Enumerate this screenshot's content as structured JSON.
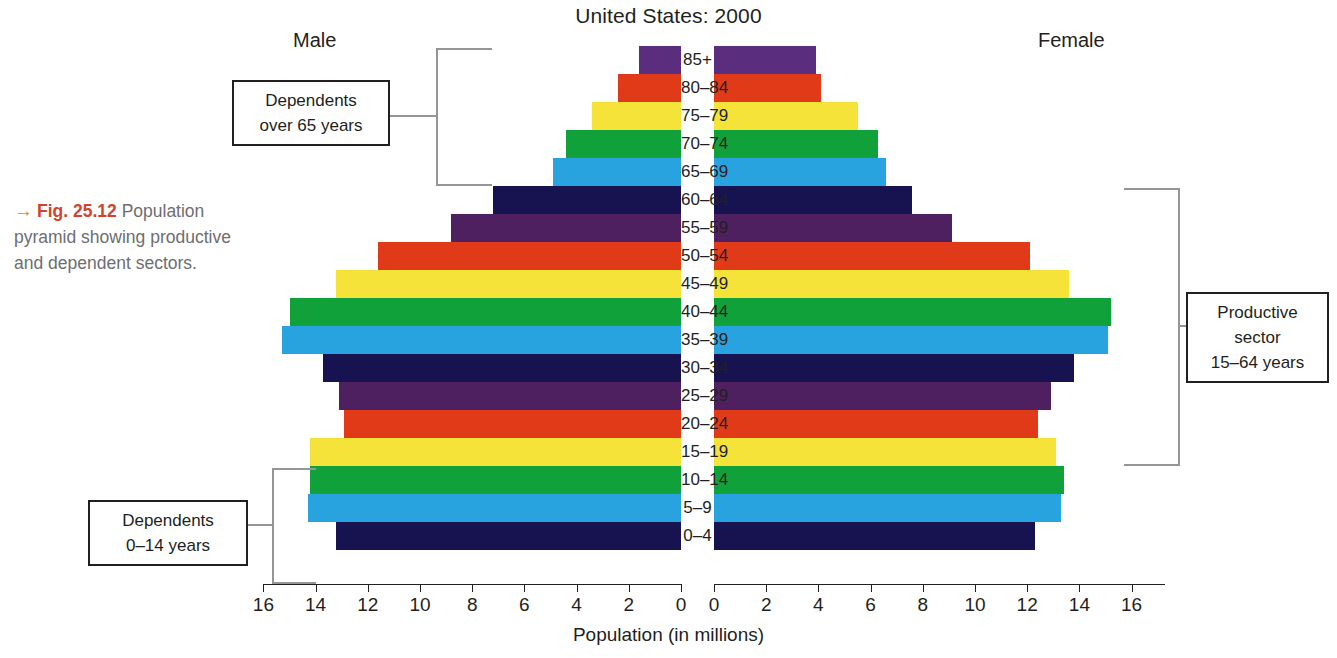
{
  "caption": {
    "arrow": "→",
    "figure_number": "Fig. 25.12",
    "text": " Population pyramid showing productive and dependent sectors."
  },
  "headers": {
    "male": "Male",
    "female": "Female"
  },
  "callouts": {
    "over65": {
      "line1": "Dependents",
      "line2": "over 65 years"
    },
    "productive": {
      "line1": "Productive",
      "line2": "sector",
      "line3": "15–64 years"
    },
    "under14": {
      "line1": "Dependents",
      "line2": "0–14 years"
    }
  },
  "axis": {
    "title": "Population (in millions)",
    "left_ticks": [
      "16",
      "14",
      "12",
      "10",
      "8",
      "6",
      "4",
      "2",
      "0"
    ],
    "right_ticks": [
      "0",
      "2",
      "4",
      "6",
      "8",
      "10",
      "12",
      "14",
      "16"
    ]
  },
  "colors": {
    "purple": "#5b2d7e",
    "red": "#e03a19",
    "yellow": "#f5e33a",
    "green": "#11a13b",
    "blue": "#29a3e0",
    "navy": "#161350",
    "plum": "#4e2060",
    "caption_grey": "#6d6e71",
    "figno_red": "#d2442a",
    "arrow_orange": "#f07d1a",
    "bracket_grey": "#939598",
    "outline": "#231f20"
  },
  "chart_data": {
    "type": "bar",
    "subtype": "population-pyramid",
    "title": "United States: 2000",
    "xlabel": "Population (in millions)",
    "ylabel": "",
    "xlim": [
      0,
      16
    ],
    "grid": false,
    "legend": "none",
    "categories": [
      "85+",
      "80–84",
      "75–79",
      "70–74",
      "65–69",
      "60–64",
      "55–59",
      "50–54",
      "45–49",
      "40–44",
      "35–39",
      "30–34",
      "25–29",
      "20–24",
      "15–19",
      "10–14",
      "5–9",
      "0–4"
    ],
    "series": [
      {
        "name": "Male",
        "direction": "left",
        "values": [
          1.6,
          2.4,
          3.4,
          4.4,
          4.9,
          7.2,
          8.8,
          11.6,
          13.2,
          15.0,
          15.3,
          13.7,
          13.1,
          12.9,
          14.2,
          14.2,
          14.3,
          13.2
        ]
      },
      {
        "name": "Female",
        "direction": "right",
        "values": [
          3.9,
          4.1,
          5.5,
          6.3,
          6.6,
          7.6,
          9.1,
          12.1,
          13.6,
          15.2,
          15.1,
          13.8,
          12.9,
          12.4,
          13.1,
          13.4,
          13.3,
          12.3
        ]
      }
    ],
    "bar_colors": [
      "purple",
      "red",
      "yellow",
      "green",
      "blue",
      "navy",
      "plum",
      "red",
      "yellow",
      "green",
      "blue",
      "navy",
      "plum",
      "red",
      "yellow",
      "green",
      "blue",
      "navy"
    ],
    "annotations": [
      {
        "label": "Dependents over 65 years",
        "covers": [
          "85+",
          "80–84",
          "75–79",
          "70–74",
          "65–69"
        ],
        "side": "left"
      },
      {
        "label": "Productive sector 15–64 years",
        "covers": [
          "60–64",
          "15–19"
        ],
        "side": "right"
      },
      {
        "label": "Dependents 0–14 years",
        "covers": [
          "10–14",
          "5–9",
          "0–4"
        ],
        "side": "left"
      }
    ]
  }
}
